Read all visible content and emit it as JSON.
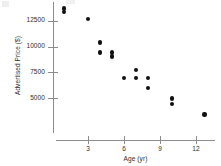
{
  "chart_data": {
    "type": "scatter",
    "title": "",
    "xlabel": "Age (yr)",
    "ylabel": "Advertised Price ($)",
    "xlim": [
      0,
      13.8
    ],
    "ylim": [
      2600,
      14200
    ],
    "xticks": [
      3,
      6,
      9,
      12
    ],
    "xtick_labels": [
      "3",
      "6",
      "9",
      "12"
    ],
    "yticks": [
      5000,
      7500,
      10000,
      12500
    ],
    "ytick_labels": [
      "5000",
      "7500",
      "10000",
      "12500"
    ],
    "grid": false,
    "legend": null,
    "marker": "filled-circle",
    "marker_color": "#111111",
    "axis_color": "#8c8c8c",
    "points": [
      {
        "x": 1.0,
        "y": 13700
      },
      {
        "x": 1.0,
        "y": 13350
      },
      {
        "x": 3.0,
        "y": 12700
      },
      {
        "x": 4.0,
        "y": 10400
      },
      {
        "x": 4.0,
        "y": 9450
      },
      {
        "x": 5.0,
        "y": 9450
      },
      {
        "x": 5.0,
        "y": 9050
      },
      {
        "x": 6.0,
        "y": 6950
      },
      {
        "x": 7.0,
        "y": 7750
      },
      {
        "x": 7.0,
        "y": 6950
      },
      {
        "x": 8.0,
        "y": 6950
      },
      {
        "x": 8.0,
        "y": 6000
      },
      {
        "x": 10.0,
        "y": 4950
      },
      {
        "x": 10.0,
        "y": 4450
      },
      {
        "x": 12.7,
        "y": 3400
      }
    ]
  }
}
